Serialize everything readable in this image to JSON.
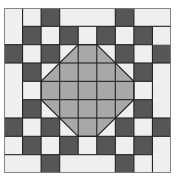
{
  "grid": {
    "rows": 9,
    "cols": 9,
    "x": 4,
    "y": 8,
    "width": 167,
    "height": 165
  },
  "colors": {
    "dark": "#565656",
    "medium": "#a8a8a8",
    "light": "#efefef",
    "line": "#222222",
    "background": "#ffffff"
  },
  "cells": [
    [
      "L",
      "L",
      "D",
      "L",
      "L",
      "L",
      "D",
      "L",
      "L"
    ],
    [
      "L",
      "D",
      "L",
      "D",
      "L",
      "D",
      "L",
      "D",
      "L"
    ],
    [
      "D",
      "L",
      "D",
      "L",
      "M",
      "L",
      "D",
      "L",
      "D"
    ],
    [
      "L",
      "D",
      "L",
      "M",
      "L",
      "M",
      "L",
      "D",
      "L"
    ],
    [
      "L",
      "L",
      "M",
      "L",
      "M",
      "L",
      "M",
      "L",
      "L"
    ],
    [
      "L",
      "D",
      "L",
      "M",
      "L",
      "M",
      "L",
      "D",
      "L"
    ],
    [
      "D",
      "L",
      "D",
      "L",
      "M",
      "L",
      "D",
      "L",
      "D"
    ],
    [
      "L",
      "D",
      "L",
      "D",
      "L",
      "D",
      "L",
      "D",
      "L"
    ],
    [
      "L",
      "L",
      "D",
      "L",
      "L",
      "L",
      "D",
      "L",
      "L"
    ]
  ],
  "strips": [
    {
      "r": 0,
      "c": 0,
      "rs": 2,
      "cs": 1
    },
    {
      "r": 0,
      "c": 3,
      "rs": 1,
      "cs": 3
    },
    {
      "r": 0,
      "c": 7,
      "rs": 1,
      "cs": 2
    },
    {
      "r": 1,
      "c": 8,
      "rs": 2,
      "cs": 1
    },
    {
      "r": 3,
      "c": 0,
      "rs": 3,
      "cs": 1
    },
    {
      "r": 3,
      "c": 8,
      "rs": 3,
      "cs": 1
    },
    {
      "r": 7,
      "c": 0,
      "rs": 1,
      "cs": 1
    },
    {
      "r": 8,
      "c": 0,
      "rs": 1,
      "cs": 2
    },
    {
      "r": 8,
      "c": 3,
      "rs": 1,
      "cs": 3
    },
    {
      "r": 7,
      "c": 8,
      "rs": 2,
      "cs": 1
    }
  ],
  "octagon": [
    [
      4,
      2
    ],
    [
      5,
      2
    ],
    [
      7,
      4
    ],
    [
      7,
      5
    ],
    [
      5,
      7
    ],
    [
      4,
      7
    ],
    [
      2,
      5
    ],
    [
      2,
      4
    ]
  ]
}
